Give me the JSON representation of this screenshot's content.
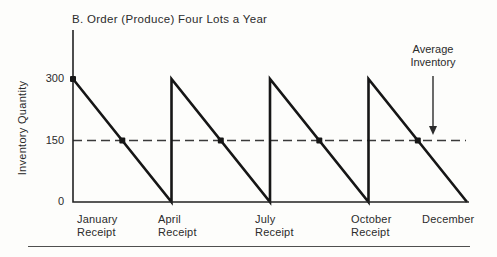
{
  "chart_data": {
    "type": "line",
    "subtype": "sawtooth-inventory",
    "title": "B. Order (Produce) Four Lots a Year",
    "ylabel": "Inventory Quantity",
    "xlabel": "",
    "x_unit": "months",
    "xlim": [
      0,
      12
    ],
    "ylim": [
      0,
      300
    ],
    "grid": false,
    "yticks": [
      {
        "label": "300",
        "value": 300
      },
      {
        "label": "150",
        "value": 150
      },
      {
        "label": "0",
        "value": 0
      }
    ],
    "xticks": [
      {
        "line1": "January",
        "line2": "Receipt",
        "month": 0
      },
      {
        "line1": "April",
        "line2": "Receipt",
        "month": 3
      },
      {
        "line1": "July",
        "line2": "Receipt",
        "month": 6
      },
      {
        "line1": "October",
        "line2": "Receipt",
        "month": 9
      },
      {
        "line1": "December",
        "line2": "",
        "month": 12
      }
    ],
    "series": [
      {
        "name": "Inventory level",
        "points": [
          [
            0,
            300
          ],
          [
            3,
            0
          ],
          [
            3,
            300
          ],
          [
            6,
            0
          ],
          [
            6,
            300
          ],
          [
            9,
            0
          ],
          [
            9,
            300
          ],
          [
            12,
            0
          ]
        ]
      }
    ],
    "average_line": {
      "value": 150,
      "style": "dashed",
      "label": "Average Inventory"
    },
    "markers": [
      [
        0,
        300
      ],
      [
        1.5,
        150
      ],
      [
        4.5,
        150
      ],
      [
        7.5,
        150
      ],
      [
        10.5,
        150
      ]
    ],
    "lot_size": 300,
    "lots_per_year": 4,
    "colors": {
      "line": "#161616",
      "axis": "#222222",
      "dashed": "#3a3a3a",
      "text": "#2b2b2b",
      "background": "#fdfdfb"
    }
  }
}
